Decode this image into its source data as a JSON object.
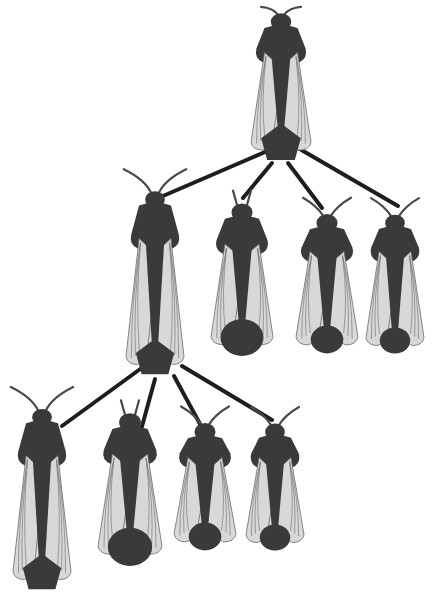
{
  "diagram": {
    "type": "tree",
    "colors": {
      "background": "#ffffff",
      "body": "#3a3a3a",
      "wing": "#d8d8d8",
      "connector": "#1e1e1e"
    },
    "nodes": [
      {
        "id": "queen",
        "generation": 1,
        "cx": 281,
        "top": 8,
        "length": 155,
        "width": 60,
        "abdomen": "pentagon",
        "antennae": "spread"
      },
      {
        "id": "gen2-a",
        "generation": 2,
        "cx": 155,
        "top": 182,
        "length": 195,
        "width": 58,
        "abdomen": "pentagon",
        "antennae": "long"
      },
      {
        "id": "gen2-b",
        "generation": 2,
        "cx": 242,
        "top": 198,
        "length": 160,
        "width": 62,
        "abdomen": "round-large",
        "antennae": "short-upright"
      },
      {
        "id": "gen2-c",
        "generation": 2,
        "cx": 327,
        "top": 210,
        "length": 145,
        "width": 62,
        "abdomen": "round-small",
        "antennae": "curved"
      },
      {
        "id": "gen2-d",
        "generation": 2,
        "cx": 395,
        "top": 210,
        "length": 145,
        "width": 58,
        "abdomen": "round-small",
        "antennae": "curved"
      },
      {
        "id": "gen3-a",
        "generation": 3,
        "cx": 42,
        "top": 400,
        "length": 192,
        "width": 58,
        "abdomen": "pentagon",
        "antennae": "long"
      },
      {
        "id": "gen3-b",
        "generation": 3,
        "cx": 130,
        "top": 408,
        "length": 160,
        "width": 64,
        "abdomen": "round-large",
        "antennae": "segmented"
      },
      {
        "id": "gen3-c",
        "generation": 3,
        "cx": 205,
        "top": 420,
        "length": 132,
        "width": 62,
        "abdomen": "round-small",
        "antennae": "curved"
      },
      {
        "id": "gen3-d",
        "generation": 3,
        "cx": 275,
        "top": 420,
        "length": 132,
        "width": 58,
        "abdomen": "round-small",
        "antennae": "curved"
      }
    ],
    "edges": [
      {
        "from": "queen",
        "to": "gen2-a",
        "x1": 265,
        "y1": 152,
        "x2": 163,
        "y2": 196
      },
      {
        "from": "queen",
        "to": "gen2-b",
        "x1": 272,
        "y1": 163,
        "x2": 243,
        "y2": 198
      },
      {
        "from": "queen",
        "to": "gen2-c",
        "x1": 288,
        "y1": 163,
        "x2": 322,
        "y2": 208
      },
      {
        "from": "queen",
        "to": "gen2-d",
        "x1": 298,
        "y1": 148,
        "x2": 398,
        "y2": 206
      },
      {
        "from": "gen2-a",
        "to": "gen3-a",
        "x1": 143,
        "y1": 367,
        "x2": 62,
        "y2": 426
      },
      {
        "from": "gen2-a",
        "to": "gen3-b",
        "x1": 155,
        "y1": 379,
        "x2": 141,
        "y2": 430
      },
      {
        "from": "gen2-a",
        "to": "gen3-c",
        "x1": 174,
        "y1": 376,
        "x2": 200,
        "y2": 424
      },
      {
        "from": "gen2-a",
        "to": "gen3-d",
        "x1": 182,
        "y1": 366,
        "x2": 272,
        "y2": 420
      }
    ]
  }
}
